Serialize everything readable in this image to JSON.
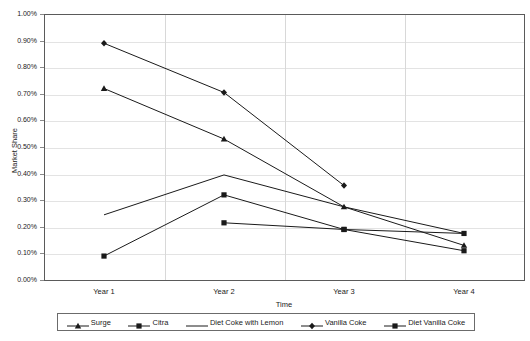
{
  "chart_data": {
    "type": "line",
    "title": "",
    "xlabel": "Time",
    "ylabel": "Market Share",
    "categories": [
      "Year 1",
      "Year 2",
      "Year 3",
      "Year 4"
    ],
    "ylim": [
      0,
      1.0
    ],
    "ytick_labels": [
      "0.00%",
      "0.10%",
      "0.20%",
      "0.30%",
      "0.40%",
      "0.50%",
      "0.60%",
      "0.70%",
      "0.80%",
      "0.90%",
      "1.00%"
    ],
    "ytick_values": [
      0,
      0.1,
      0.2,
      0.3,
      0.4,
      0.5,
      0.6,
      0.7,
      0.8,
      0.9,
      1.0
    ],
    "grid": true,
    "legend_position": "bottom",
    "units": "percent",
    "series": [
      {
        "name": "Surge",
        "marker": "triangle",
        "values": [
          0.72,
          0.53,
          0.275,
          0.13
        ],
        "color": "#1a1a1a"
      },
      {
        "name": "Citra",
        "marker": "square",
        "values": [
          0.09,
          0.32,
          0.19,
          0.11
        ],
        "color": "#1a1a1a"
      },
      {
        "name": "Diet Coke with Lemon",
        "marker": "none",
        "values": [
          0.245,
          0.395,
          0.275,
          0.175
        ],
        "color": "#1a1a1a"
      },
      {
        "name": "Vanilla Coke",
        "marker": "diamond",
        "values": [
          0.89,
          0.705,
          0.355,
          null
        ],
        "color": "#1a1a1a"
      },
      {
        "name": "Diet Vanilla Coke",
        "marker": "square",
        "values": [
          null,
          0.215,
          0.19,
          0.175
        ],
        "color": "#1a1a1a"
      }
    ]
  },
  "axes": {
    "y_title": "Market Share",
    "x_title": "Time"
  },
  "legend": {
    "items": [
      {
        "label": "Surge",
        "marker": "triangle"
      },
      {
        "label": "Citra",
        "marker": "square"
      },
      {
        "label": "Diet Coke with Lemon",
        "marker": "none"
      },
      {
        "label": "Vanilla Coke",
        "marker": "diamond"
      },
      {
        "label": "Diet Vanilla Coke",
        "marker": "square"
      }
    ]
  },
  "colors": {
    "line": "#1a1a1a",
    "grid": "#e3e3e3",
    "frame": "#5a5a5a",
    "background": "#ffffff"
  }
}
